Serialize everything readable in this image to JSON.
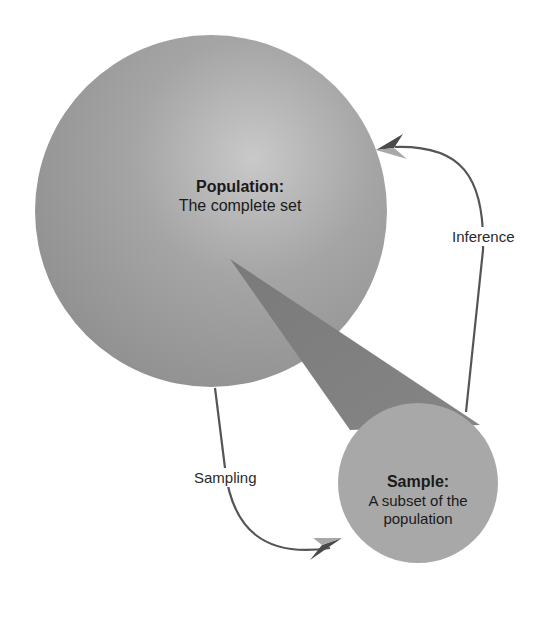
{
  "diagram": {
    "type": "concept-diagram",
    "nodes": {
      "population": {
        "title": "Population:",
        "subtitle": "The complete set",
        "shape": "circle",
        "color": "#9a9a9a"
      },
      "sample": {
        "title": "Sample:",
        "subtitle_line1": "A subset of the",
        "subtitle_line2": "population",
        "shape": "circle",
        "color": "#a6a6a6"
      }
    },
    "edges": {
      "sampling": {
        "label": "Sampling",
        "from": "population",
        "to": "sample"
      },
      "inference": {
        "label": "Inference",
        "from": "sample",
        "to": "population"
      }
    },
    "colors": {
      "background": "#ffffff",
      "cone": "#7d7d7d",
      "arrow_stroke": "#555555",
      "arrowhead_dark": "#4a4a4a",
      "arrowhead_light": "#a8a8a8",
      "text": "#1a1a1a"
    }
  }
}
